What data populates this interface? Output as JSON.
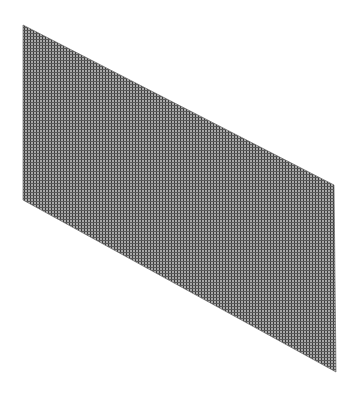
{
  "figure": {
    "kind": "wireframe-plane",
    "background": "#ffffff",
    "fill_color": "#9a9a9a",
    "line_color": "#3a3a3a",
    "grid_pitch_px": 3,
    "polygon": [
      [
        23,
        25
      ],
      [
        334,
        185
      ],
      [
        336,
        372
      ],
      [
        23,
        200
      ]
    ]
  }
}
